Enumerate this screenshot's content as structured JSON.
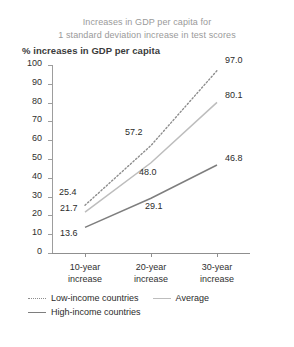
{
  "chart": {
    "title_lines": [
      "Increases in GDP per capita for",
      "1 standard deviation increase in test scores"
    ],
    "axis_title": "% increases in GDP per capita"
  },
  "chart_data": {
    "type": "line",
    "title": "Increases in GDP per capita for 1 standard deviation increase in test scores",
    "xlabel": "",
    "ylabel": "% increases in GDP per capita",
    "categories": [
      "10-year increase",
      "20-year increase",
      "30-year increase"
    ],
    "category_lines": [
      [
        "10-year",
        "increase"
      ],
      [
        "20-year",
        "increase"
      ],
      [
        "30-year",
        "increase"
      ]
    ],
    "ylim": [
      0,
      100
    ],
    "yticks": [
      0,
      10,
      20,
      30,
      40,
      50,
      60,
      70,
      80,
      90,
      100
    ],
    "ytick_labels": [
      "0",
      "10",
      "20",
      "30",
      "40",
      "50",
      "60",
      "70",
      "80",
      "90",
      "100"
    ],
    "grid": false,
    "legend_position": "below",
    "series": [
      {
        "name": "Low-income countries",
        "style": "dotted",
        "color": "#8d8d8d",
        "values": [
          25.4,
          57.2,
          97.0
        ],
        "labels": [
          "25.4",
          "57.2",
          "97.0"
        ]
      },
      {
        "name": "Average",
        "style": "solid",
        "color": "#bdbdbd",
        "values": [
          21.7,
          48.0,
          80.1
        ],
        "labels": [
          "21.7",
          "48.0",
          "80.1"
        ]
      },
      {
        "name": "High-income countries",
        "style": "solid",
        "color": "#7e7e7e",
        "values": [
          13.6,
          29.1,
          46.8
        ],
        "labels": [
          "13.6",
          "29.1",
          "46.8"
        ]
      }
    ]
  }
}
